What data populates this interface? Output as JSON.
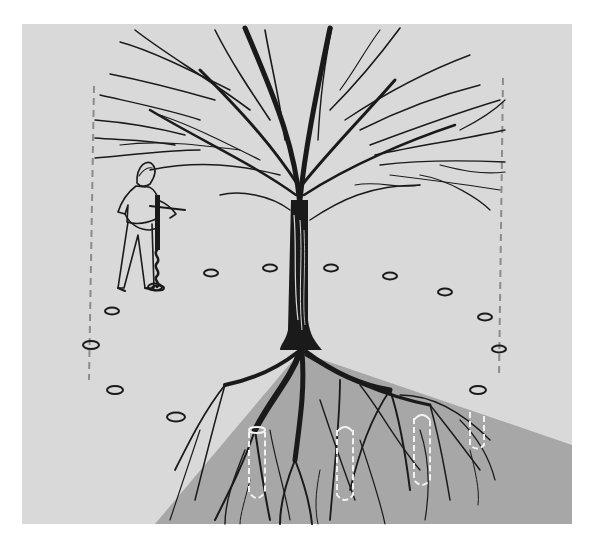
{
  "figure": {
    "colors": {
      "page_background": "#ffffff",
      "panel_background": "#d9d9d9",
      "soil_cutaway": "#a7a7a7",
      "ink": "#1a1a1a",
      "drip_line_dash": "#8c8c8c",
      "fertilizer_hole_outline": "#f2f2f2"
    },
    "elements": {
      "tree": "bare deciduous tree with spreading crown",
      "person": "man operating a hand auger",
      "drip_lines": "two vertical dashed lines marking canopy edge",
      "surface_holes": 14,
      "cutaway_holes": 4,
      "soil_cutaway": "wedge section showing root system"
    }
  }
}
